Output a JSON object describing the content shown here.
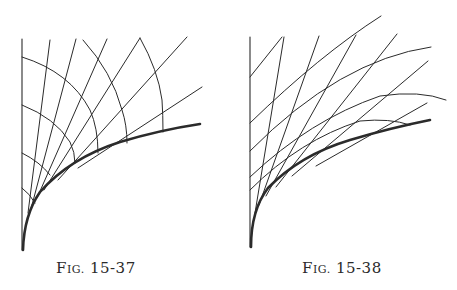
{
  "figures": [
    {
      "id": "left",
      "caption": {
        "prefix_initial": "F",
        "prefix_rest": "IG.",
        "number": "15-37"
      },
      "description": "Thick curve with straight rays and orthogonal circular arcs (line family and orthogonal trajectories)",
      "stroke_color": "#2b2b2b"
    },
    {
      "id": "right",
      "caption": {
        "prefix_initial": "F",
        "prefix_rest": "IG.",
        "number": "15-38"
      },
      "description": "Thick curve with crossing families of straight lines and arcs",
      "stroke_color": "#2b2b2b"
    }
  ]
}
